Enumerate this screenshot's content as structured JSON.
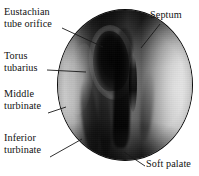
{
  "figure": {
    "type": "labeled-anatomical-photograph",
    "background_color": "#ffffff",
    "text_color": "#111111",
    "leader_line_color": "#1a1a1a",
    "viewport": {
      "width": 199,
      "height": 176
    }
  },
  "image_region": {
    "shape": "circle",
    "center_x": 125,
    "center_y": 85,
    "radius": 68,
    "border_color": "#0b0b0b",
    "palette": {
      "darkest": "#000000",
      "mid_gray": "#6e6e6e",
      "light_gray": "#bfbfbf",
      "highlight": "#d8d8d8"
    }
  },
  "labels": [
    {
      "id": "eustachian-tube-orifice",
      "lines": [
        "Eustachian",
        "tube orifice"
      ],
      "side": "left",
      "leader": {
        "x1": 62,
        "y1": 28,
        "x2": 103,
        "y2": 47
      }
    },
    {
      "id": "torus-tubarius",
      "lines": [
        "Torus",
        "tubarius"
      ],
      "side": "left",
      "leader": {
        "x1": 47,
        "y1": 70,
        "x2": 86,
        "y2": 72
      }
    },
    {
      "id": "middle-turbinate",
      "lines": [
        "Middle",
        "turbinate"
      ],
      "side": "left",
      "leader": {
        "x1": 48,
        "y1": 113,
        "x2": 66,
        "y2": 107
      }
    },
    {
      "id": "inferior-turbinate",
      "lines": [
        "Inferior",
        "turbinate"
      ],
      "side": "left",
      "leader": {
        "x1": 50,
        "y1": 157,
        "x2": 82,
        "y2": 139
      }
    },
    {
      "id": "septum",
      "lines": [
        "Septum"
      ],
      "side": "right",
      "leader": {
        "x1": 160,
        "y1": 24,
        "x2": 141,
        "y2": 48
      }
    },
    {
      "id": "soft-palate",
      "lines": [
        "Soft palate"
      ],
      "side": "right",
      "leader": {
        "x1": 145,
        "y1": 166,
        "x2": 124,
        "y2": 152
      }
    }
  ]
}
